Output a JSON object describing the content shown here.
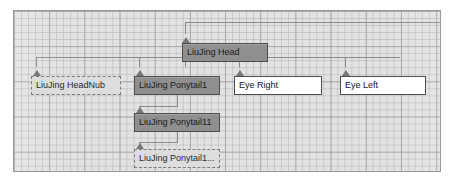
{
  "canvas": {
    "label": "hierarchy-graph-canvas",
    "background_color": "#e2e2e2",
    "grid_line_color": "#b0b0b0",
    "grid_major_color": "#8c8c8c",
    "border_color": "#9a9a9a",
    "wire_color": "#8a8a8a"
  },
  "nodes": [
    {
      "id": "liujing-head",
      "label": "LiuJing Head",
      "style": "dark",
      "selected": true,
      "x": 181,
      "y": 33,
      "w": 86,
      "fill": "#8f8f8f",
      "border": "#4e4e4e",
      "handle": "triangle-handle"
    },
    {
      "id": "liujing-headnub",
      "label": "LiuJing HeadNub",
      "style": "ghost",
      "selected": false,
      "x": 30,
      "y": 66,
      "w": 90,
      "fill": "#dddddd",
      "border": "#7d7d7d",
      "handle": "triangle-handle"
    },
    {
      "id": "liujing-ponytail1",
      "label": "LiuJing Ponytail1",
      "style": "dark",
      "selected": true,
      "x": 133,
      "y": 66,
      "w": 86,
      "fill": "#8f8f8f",
      "border": "#4e4e4e",
      "handle": "triangle-handle"
    },
    {
      "id": "liujing-ponytail11",
      "label": "LiuJing Ponytail11",
      "style": "dark",
      "selected": true,
      "x": 133,
      "y": 103,
      "w": 86,
      "fill": "#8f8f8f",
      "border": "#4e4e4e",
      "handle": "triangle-handle"
    },
    {
      "id": "liujing-ponytail1-truncated",
      "label": "LiuJing Ponytail1...",
      "style": "ghost",
      "selected": false,
      "x": 133,
      "y": 139,
      "w": 86,
      "fill": "#dddddd",
      "border": "#7d7d7d",
      "handle": "triangle-handle"
    },
    {
      "id": "eye-right",
      "label": "Eye Right",
      "style": "plain",
      "selected": false,
      "x": 233,
      "y": 66,
      "w": 88,
      "fill": "#ffffff",
      "border": "#4e4e4e",
      "handle": "triangle-handle"
    },
    {
      "id": "eye-left",
      "label": "Eye Left",
      "style": "plain",
      "selected": false,
      "x": 339,
      "y": 66,
      "w": 86,
      "fill": "#ffffff",
      "border": "#4e4e4e",
      "handle": "triangle-handle"
    }
  ],
  "connections": [
    {
      "from": "parent-bus",
      "to": "liujing-head",
      "kind": "top-bus"
    },
    {
      "from": "liujing-head",
      "to": "liujing-headnub",
      "kind": "branch"
    },
    {
      "from": "liujing-head",
      "to": "liujing-ponytail1",
      "kind": "branch"
    },
    {
      "from": "liujing-head",
      "to": "eye-right",
      "kind": "branch"
    },
    {
      "from": "liujing-head",
      "to": "eye-left",
      "kind": "branch"
    },
    {
      "from": "liujing-ponytail1",
      "to": "liujing-ponytail11",
      "kind": "chain"
    },
    {
      "from": "liujing-ponytail11",
      "to": "liujing-ponytail1-truncated",
      "kind": "chain"
    }
  ]
}
